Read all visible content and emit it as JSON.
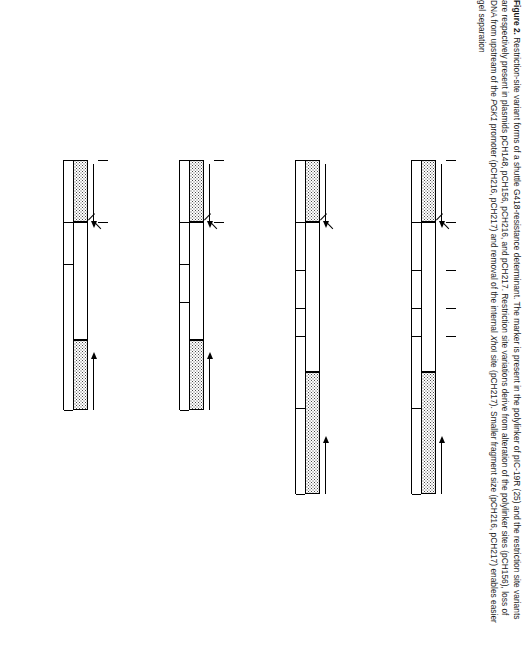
{
  "figure": {
    "number": "Figure 2.",
    "caption_runs": [
      {
        "text": "Restriction-site variant forms of a shuttle G418-resistance determinant. The marker is present in the polylinker of pIC-19R (25) and the restriction site variants are respectively present in plasmids pCH148, pCH156, pCH216, and pCH217. Restriction site variations derive from alteration of the polylinker sites (pCH156), loss of DNA from upstream of the ",
        "style": "normal"
      },
      {
        "text": "PGK1",
        "style": "italic"
      },
      {
        "text": " promoter (pCH216, pCH217) and removal of the internal ",
        "style": "normal"
      },
      {
        "text": "Xho",
        "style": "italic"
      },
      {
        "text": "I site (pCH217). Smaller fragment size (pCH216, pCH217) enables easier gel separation",
        "style": "normal"
      }
    ]
  },
  "constructs": [
    {
      "name": "G418",
      "superscript": "R",
      "bracket": "[148]",
      "size": "2.8 kb",
      "promoter_label": "PGK",
      "promoter_italic": "1",
      "promoter_right_label": "PGK",
      "promoter_right_italic": "pr",
      "gene": "APT1",
      "polylinker": [
        "EcoRI",
        "ClaI",
        "EcoRV",
        "XbaI",
        "BglII",
        "XhoI",
        "SstI",
        "NruI"
      ],
      "right_sites": [
        "PstI",
        "SalI",
        "BamHI",
        "SmaI",
        "EcoRI"
      ],
      "sites": [
        "HindIII",
        "BglII",
        "HindIII",
        "SmaI",
        "XhoI",
        "XmnI",
        "HindIII"
      ],
      "segments": [
        "376",
        "462",
        "246",
        "274",
        "614",
        "~820"
      ]
    },
    {
      "name": "G418",
      "superscript": "R",
      "bracket": "[156]",
      "size": "2.8 kb",
      "promoter_label": "PGK",
      "promoter_italic": "1",
      "promoter_right_label": "PGK",
      "promoter_right_italic": "pr",
      "gene": "APT1",
      "polylinker": [
        "EcoRI",
        "ClaI",
        "EcoRV",
        "XbaI",
        "BglII",
        "XhoI",
        "PstI",
        "BamHI",
        "PstI",
        "NruI"
      ],
      "right_sites": [
        "PstI",
        "SalI",
        "BamHI",
        "SmaI",
        "EcoRI"
      ],
      "sites": [
        "HindIII",
        "BglII",
        "HindIII",
        "SmaI",
        "XhoI",
        "XmnI",
        "HindIII"
      ],
      "segments": []
    },
    {
      "name": "G418",
      "superscript": "R",
      "bracket": "[216]",
      "size": "2.0 kb",
      "promoter_label": "PGK",
      "promoter_italic": "1",
      "promoter_right_label": "PGK",
      "promoter_right_italic": "pr",
      "gene": "APT1",
      "polylinker": [
        "EcoRI",
        "ClaI",
        "EcoRV",
        "XbaI",
        "BglII",
        "XhoI",
        "SstI",
        "NruI"
      ],
      "right_sites": [
        "PstI",
        "SalI",
        "BamHI",
        "SmaI",
        "EcoRI"
      ],
      "sites": [
        "XhoI",
        "SmaI",
        "HindIII",
        "BglII",
        "HindIII"
      ],
      "segments": [
        "614"
      ]
    },
    {
      "name": "G418",
      "superscript": "R",
      "bracket": "[217]",
      "size": "2.0 kb",
      "promoter_label": "PGK",
      "promoter_italic": "1",
      "promoter_right_label": "PGK",
      "promoter_right_italic": "pr",
      "gene": "APT1",
      "polylinker": [
        "EcoRI",
        "ClaI",
        "EcoRV",
        "XbaI",
        "BglII",
        "XhoI",
        "SstI",
        "NruI"
      ],
      "right_sites": [
        "PstI",
        "SalI",
        "BamHI",
        "SmaI",
        "EcoRI"
      ],
      "sites": [
        "SmaI",
        "HindIII",
        "BglII",
        "HindIII"
      ],
      "segments": [
        "888"
      ]
    }
  ]
}
